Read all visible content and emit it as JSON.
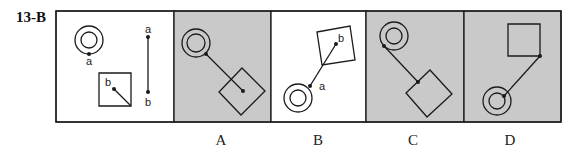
{
  "title": "13-B",
  "colors": {
    "stroke": "#1a1a1a",
    "shaded": "#c9c9c9",
    "plain": "#ffffff"
  },
  "frame": {
    "x": 56,
    "y": 11,
    "w": 505,
    "h": 111
  },
  "panels": [
    {
      "id": "question",
      "x": 56,
      "w": 118,
      "shaded": false,
      "label": ""
    },
    {
      "id": "A",
      "x": 174,
      "w": 97,
      "shaded": true,
      "label": "A"
    },
    {
      "id": "B",
      "x": 271,
      "w": 95,
      "shaded": false,
      "label": "B"
    },
    {
      "id": "C",
      "x": 366,
      "w": 98,
      "shaded": true,
      "label": "C"
    },
    {
      "id": "D",
      "x": 464,
      "w": 97,
      "shaded": true,
      "label": "D"
    }
  ],
  "question": {
    "ring": {
      "cx": 89,
      "cy": 40,
      "r_outer": 14,
      "r_inner": 8,
      "point": {
        "x": 89,
        "y": 54,
        "label": "a"
      }
    },
    "square": {
      "points": "99,73 131,73 131,106 99,106",
      "point": {
        "x": 114,
        "y": 89,
        "label": "b"
      },
      "line_to": {
        "x": 131,
        "y": 106
      }
    },
    "segment": {
      "x": 148,
      "y1": 37,
      "y2": 92,
      "top_label": "a",
      "bottom_label": "b"
    }
  },
  "options": {
    "A": {
      "ring": {
        "cx": 196,
        "cy": 43,
        "r_outer": 14,
        "r_inner": 9
      },
      "square": "242,68 265,91 241,115 219,92",
      "line": [
        206,
        54,
        243,
        91
      ],
      "dots": [
        [
          206,
          54
        ],
        [
          243,
          91
        ]
      ],
      "labels": []
    },
    "B": {
      "ring": {
        "cx": 298,
        "cy": 98,
        "r_outer": 14,
        "r_inner": 8
      },
      "square": "317,32 350,26 355,60 322,65",
      "line": [
        310,
        86,
        336,
        44
      ],
      "dots": [
        [
          310,
          86
        ],
        [
          336,
          44
        ]
      ],
      "labels": [
        {
          "text": "a",
          "x": 322,
          "y": 90
        },
        {
          "text": "b",
          "x": 341,
          "y": 42
        }
      ]
    },
    "C": {
      "ring": {
        "cx": 394,
        "cy": 36,
        "r_outer": 14,
        "r_inner": 8
      },
      "square": "430,70 452,94 427,117 406,93",
      "line": [
        384,
        46,
        418,
        82
      ],
      "dots": [
        [
          384,
          46
        ],
        [
          418,
          82
        ]
      ],
      "labels": []
    },
    "D": {
      "ring": {
        "cx": 497,
        "cy": 101,
        "r_outer": 14,
        "r_inner": 8
      },
      "square": "508,24 540,24 540,56 508,56",
      "line": [
        540,
        56,
        504,
        96
      ],
      "dots": [
        [
          540,
          56
        ],
        [
          504,
          96
        ]
      ],
      "labels": []
    }
  },
  "option_labels": [
    {
      "text": "A",
      "x": 211
    },
    {
      "text": "B",
      "x": 308
    },
    {
      "text": "C",
      "x": 403
    },
    {
      "text": "D",
      "x": 500
    }
  ]
}
